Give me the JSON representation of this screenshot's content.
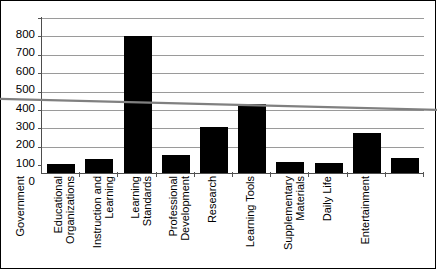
{
  "chart_data": {
    "type": "bar",
    "title": "",
    "subtitle": "",
    "xlabel": "",
    "ylabel": "",
    "categories": [
      "Government",
      "Educational Organizations",
      "Instruction and Learning",
      "Learning Standards",
      "Professional Development",
      "Research",
      "Learning Tools",
      "Supplementary Materials",
      "Daily Life",
      "Entertainment"
    ],
    "values": [
      45,
      70,
      705,
      90,
      235,
      355,
      55,
      50,
      205,
      75
    ],
    "series": [
      {
        "name": "Count",
        "type": "bar",
        "values": [
          45,
          70,
          705,
          90,
          235,
          355,
          55,
          50,
          205,
          75
        ],
        "color": "#000000"
      },
      {
        "name": "Linear trend",
        "type": "line",
        "color": "#808080",
        "start_value": 375,
        "end_value": 325
      }
    ],
    "ylim": [
      0,
      800
    ],
    "yticks": [
      0,
      100,
      200,
      300,
      400,
      500,
      600,
      700,
      800
    ],
    "ytick_labels": [
      "0",
      "100",
      "200",
      "300",
      "400",
      "500",
      "600",
      "700",
      "800"
    ],
    "grid": true,
    "grid_axis": "y",
    "legend": false,
    "legend_position": "none",
    "bar_color": "#000000",
    "gridline_color": "#9a9a9a",
    "axis_color": "#4d4d4d",
    "trendline_color": "#808080",
    "background": "#ffffff",
    "border_color": "#000000"
  }
}
